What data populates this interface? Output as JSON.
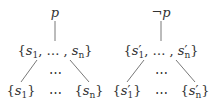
{
  "trees": [
    {
      "root": "p",
      "middle": {
        "open": "{",
        "first": "s",
        "first_sub": "1",
        "sep": ", … , ",
        "last": "s",
        "last_sub": "n",
        "close": "}",
        "prime": ""
      },
      "middle_dots": "⋯",
      "leaves": [
        {
          "label": "s",
          "sub": "1"
        },
        {
          "label": "⋯"
        },
        {
          "label": "s",
          "sub": "n"
        }
      ]
    },
    {
      "root": "¬p",
      "middle": {
        "open": "{",
        "first": "s",
        "first_sub": "1",
        "sep": ", … , ",
        "last": "s",
        "last_sub": "n",
        "close": "}",
        "prime": "′"
      },
      "middle_dots": "⋯",
      "leaves": [
        {
          "label": "s",
          "sub": "1",
          "prime": "′"
        },
        {
          "label": "⋯"
        },
        {
          "label": "s",
          "sub": "n",
          "prime": "′"
        }
      ]
    }
  ]
}
